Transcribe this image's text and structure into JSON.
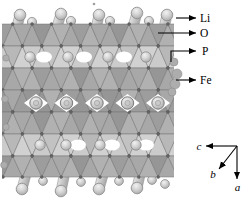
{
  "legend": {
    "items": [
      {
        "name": "lithium",
        "label": "Li"
      },
      {
        "name": "oxygen",
        "label": "O"
      },
      {
        "name": "phosphorus",
        "label": "P"
      },
      {
        "name": "iron",
        "label": "Fe"
      }
    ]
  },
  "axes": {
    "c_label": "c",
    "b_label": "b",
    "a_label": "a"
  },
  "colors": {
    "background": "#ffffff",
    "annotation": "#000000",
    "polyhedron_dark": "#9e9e9e",
    "polyhedron_light": "#c4c4c4",
    "polyhedron_edge": "#707070",
    "lithium_sphere": "#d6d6d6",
    "vertex_atom": "#666666"
  }
}
